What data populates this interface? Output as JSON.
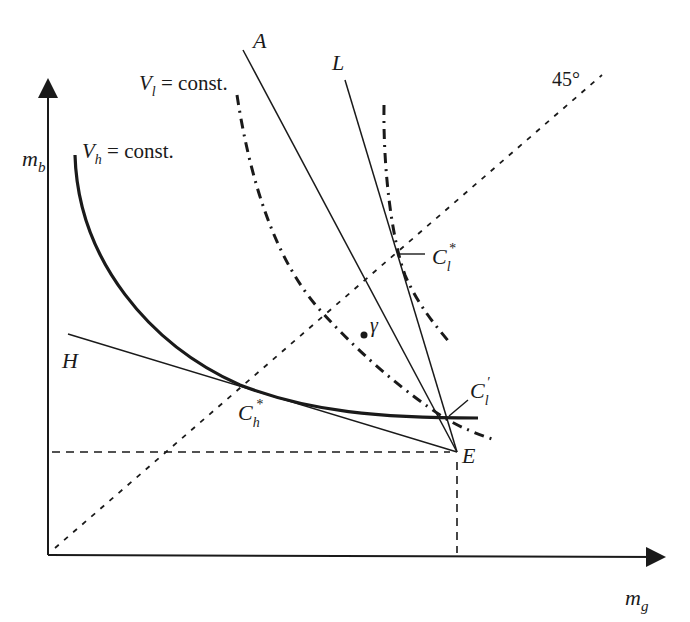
{
  "diagram": {
    "type": "economics-indifference-curve-diagram",
    "colors": {
      "ink": "#1a1a1a",
      "background": "#ffffff"
    },
    "axes": {
      "x_label": {
        "base": "m",
        "sub": "g"
      },
      "y_label": {
        "base": "m",
        "sub": "b"
      }
    },
    "lines": {
      "A": {
        "label": "A"
      },
      "L": {
        "label": "L"
      },
      "H": {
        "label": "H"
      },
      "diag45": {
        "label": "45°"
      }
    },
    "curves": {
      "Vh": {
        "base": "V",
        "sub": "h",
        "rest": " = const."
      },
      "Vl": {
        "base": "V",
        "sub": "l",
        "rest": " = const."
      }
    },
    "points": {
      "E": {
        "label": "E"
      },
      "gamma": {
        "label": "γ"
      },
      "Ch_star": {
        "base": "C",
        "sub": "h",
        "sup": "*"
      },
      "Cl_star": {
        "base": "C",
        "sub": "l",
        "sup": "*"
      },
      "Cl_prime": {
        "base": "C",
        "sub": "l",
        "sup": "′"
      }
    }
  }
}
